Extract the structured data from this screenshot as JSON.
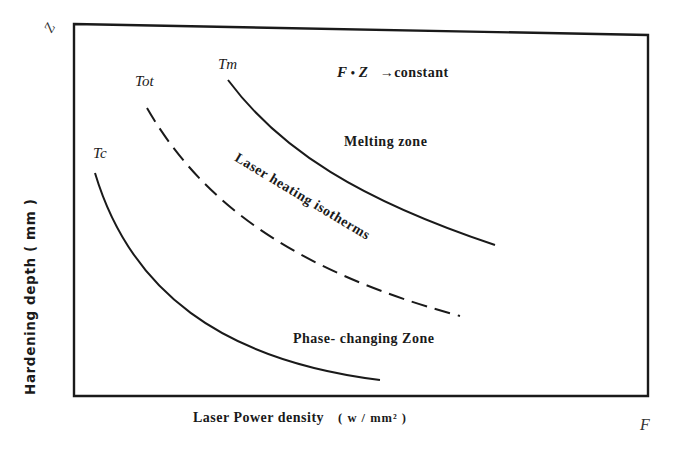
{
  "figure": {
    "y_axis_letter": "Z",
    "x_axis_letter": "F",
    "y_label": "Hardening depth ( mm )",
    "x_label": "Laser Power density",
    "x_unit": "( w / mm² )",
    "formula": {
      "lhs_f": "F",
      "dot": "•",
      "lhs_z": "Z",
      "rhs": "→constant"
    },
    "zones": {
      "melting": "Melting zone",
      "isotherms": "Laser heating isotherms",
      "phase": "Phase- changing Zone"
    },
    "curves": [
      {
        "id": "Tm",
        "label": "Tm",
        "style": "solid"
      },
      {
        "id": "Tot",
        "label": "Tot",
        "style": "dashed"
      },
      {
        "id": "Tc",
        "label": "Tc",
        "style": "solid"
      }
    ],
    "colors": {
      "ink": "#1a1a1a",
      "background": "#ffffff"
    }
  }
}
